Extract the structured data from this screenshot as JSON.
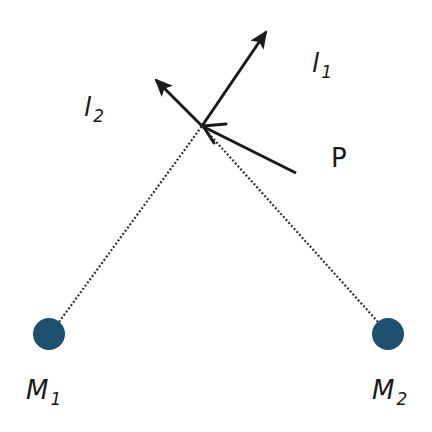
{
  "diagram": {
    "title": "",
    "point_label": "P",
    "vectors": [
      {
        "id": "l1",
        "label": "l",
        "subscript": "1",
        "from": [
          202,
          126
        ],
        "to": [
          266,
          32
        ]
      },
      {
        "id": "l2",
        "label": "l",
        "subscript": "2",
        "from": [
          202,
          126
        ],
        "to": [
          156,
          80
        ]
      },
      {
        "id": "incoming",
        "label": "P",
        "from": [
          296,
          173
        ],
        "to": [
          202,
          126
        ]
      }
    ],
    "masses": [
      {
        "id": "M1",
        "label": "M",
        "subscript": "1",
        "center": [
          49,
          334
        ],
        "radius": 16
      },
      {
        "id": "M2",
        "label": "M",
        "subscript": "2",
        "center": [
          388,
          334
        ],
        "radius": 16
      }
    ],
    "colors": {
      "mass_fill": "#1d4f6e",
      "line": "#1a1a1a",
      "dotted_line": "#333333"
    }
  }
}
